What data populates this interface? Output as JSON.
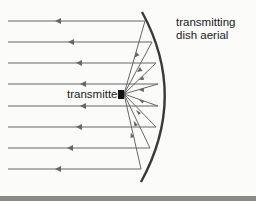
{
  "diagram": {
    "title": "Transmitting dish aerial",
    "labels": {
      "dish_line1": "transmitting",
      "dish_line2": "dish aerial",
      "transmitter": "transmitter"
    },
    "colors": {
      "rays": "#666666",
      "dish": "#3a3a3a",
      "transmitter": "#111111",
      "background": "#fbfbfa"
    },
    "parallel_rays_y": [
      21,
      42,
      63,
      84,
      106,
      127,
      148,
      169
    ],
    "ray_direction": "left"
  }
}
